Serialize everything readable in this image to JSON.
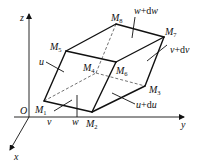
{
  "figure": {
    "type": "parallelepiped-element",
    "axes": {
      "origin_label": "O",
      "x_label": "x",
      "y_label": "y",
      "z_label": "z"
    },
    "vertices": [
      {
        "id": "M1",
        "label": "M",
        "sub": "1"
      },
      {
        "id": "M2",
        "label": "M",
        "sub": "2"
      },
      {
        "id": "M3",
        "label": "M",
        "sub": "3"
      },
      {
        "id": "M4",
        "label": "M",
        "sub": "4"
      },
      {
        "id": "M5",
        "label": "M",
        "sub": "5"
      },
      {
        "id": "M6",
        "label": "M",
        "sub": "6"
      },
      {
        "id": "M7",
        "label": "M",
        "sub": "7"
      },
      {
        "id": "M8",
        "label": "M",
        "sub": "8"
      }
    ],
    "face_labels": {
      "u": "u",
      "v": "v",
      "w": "w",
      "u_du": {
        "var": "u",
        "plus": "+d",
        "var2": "u"
      },
      "v_dv": {
        "var": "v",
        "plus": "+d",
        "var2": "v"
      },
      "w_dw": {
        "var": "w",
        "plus": "+d",
        "var2": "w"
      }
    },
    "colors": {
      "line": "#111111",
      "background": "#ffffff"
    }
  }
}
